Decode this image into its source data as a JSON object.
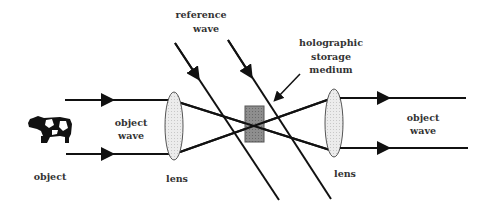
{
  "diagram": {
    "labels": {
      "reference_wave_1": "reference",
      "reference_wave_2": "wave",
      "holo_1": "holographic",
      "holo_2": "storage",
      "holo_3": "medium",
      "object_wave_left_1": "object",
      "object_wave_left_2": "wave",
      "object_wave_right_1": "object",
      "object_wave_right_2": "wave",
      "object": "object",
      "lens_left": "lens",
      "lens_right": "lens"
    },
    "icons": {
      "object": "cow-icon",
      "lens": "lens-ellipse",
      "medium": "storage-medium-block"
    },
    "colors": {
      "line": "#111111",
      "lens_fill": "#e8e8e8",
      "medium_fill": "#8a8a8a",
      "text": "#333333"
    }
  }
}
